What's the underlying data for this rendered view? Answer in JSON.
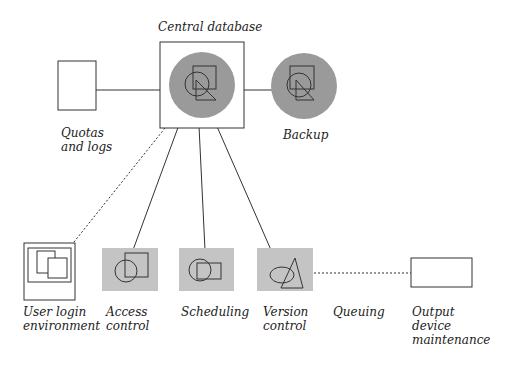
{
  "diagram": {
    "colors": {
      "node_fill": "#9a9a9a",
      "box_fill": "#c4c4c4",
      "stroke": "#333333",
      "background": "#ffffff"
    },
    "nodes": {
      "central_database": {
        "label": "Central database",
        "shape": "circle-in-square",
        "icon": "circle-square-triangle-icon"
      },
      "backup": {
        "label": "Backup",
        "shape": "circle",
        "icon": "circle-square-triangle-icon"
      },
      "quotas_and_logs": {
        "label_line1": "Quotas",
        "label_line2": "and logs",
        "shape": "empty-rectangle"
      },
      "user_login_environment": {
        "label_line1": "User login",
        "label_line2": "environment",
        "shape": "window-frame",
        "icon": "overlapping-windows-icon"
      },
      "access_control": {
        "label_line1": "Access",
        "label_line2": "control",
        "shape": "gray-box",
        "icon": "circle-square-icon"
      },
      "scheduling": {
        "label": "Scheduling",
        "shape": "gray-box",
        "icon": "circle-rectangle-icon"
      },
      "version_control": {
        "label_line1": "Version",
        "label_line2": "control",
        "shape": "gray-box",
        "icon": "ellipse-triangle-icon"
      },
      "queuing": {
        "label": "Queuing"
      },
      "output_device_maintenance": {
        "label_line1": "Output",
        "label_line2": "device",
        "label_line3": "maintenance",
        "shape": "empty-rectangle"
      }
    },
    "edges": [
      {
        "from": "quotas_and_logs",
        "to": "central_database",
        "style": "solid"
      },
      {
        "from": "central_database",
        "to": "backup",
        "style": "solid"
      },
      {
        "from": "central_database",
        "to": "user_login_environment",
        "style": "dashed"
      },
      {
        "from": "central_database",
        "to": "access_control",
        "style": "solid"
      },
      {
        "from": "central_database",
        "to": "scheduling",
        "style": "solid"
      },
      {
        "from": "central_database",
        "to": "version_control",
        "style": "solid"
      },
      {
        "from": "version_control",
        "to": "output_device_maintenance",
        "style": "dashed"
      }
    ]
  }
}
